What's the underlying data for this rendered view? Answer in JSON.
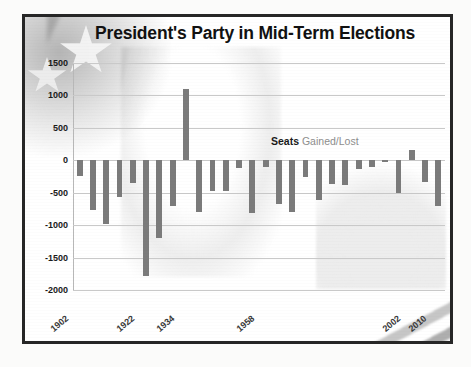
{
  "chart": {
    "title": "President's Party in Mid-Term Elections",
    "legend_bold": "Seats",
    "legend_light": "Gained/Lost",
    "bar_color": "#7b7b7b",
    "grid_color": "#c9c9c9",
    "frame_color": "#262626"
  },
  "chart_data": {
    "type": "bar",
    "title": "President's Party in Mid-Term Elections",
    "subtitle": "",
    "xlabel": "",
    "ylabel": "",
    "ylim": [
      -2000,
      1500
    ],
    "yticks": [
      1500,
      1000,
      500,
      0,
      -500,
      -1000,
      -1500,
      -2000
    ],
    "ytick_labels": [
      "1500",
      "1000",
      "500",
      "0",
      "-500",
      "-1000",
      "-1500",
      "-2000"
    ],
    "grid": true,
    "legend": "Seats Gained/Lost",
    "legend_position": "inside-upper-right",
    "xtick_labels": [
      "1902",
      "1922",
      "1934",
      "1958",
      "2002",
      "2010"
    ],
    "xtick_indices": [
      0,
      5,
      8,
      14,
      25,
      27
    ],
    "categories": [
      "1902",
      "1906",
      "1910",
      "1914",
      "1918",
      "1922",
      "1926",
      "1930",
      "1934",
      "1938",
      "1942",
      "1946",
      "1950",
      "1954",
      "1958",
      "1962",
      "1966",
      "1970",
      "1974",
      "1978",
      "1982",
      "1986",
      "1990",
      "1994",
      "1998",
      "2002",
      "2006",
      "2010"
    ],
    "values": [
      -240,
      -760,
      -980,
      -570,
      -350,
      -1790,
      -1200,
      -700,
      1100,
      -790,
      -480,
      -470,
      -120,
      -820,
      -100,
      -670,
      -790,
      -260,
      -620,
      -370,
      -380,
      -140,
      -110,
      -30,
      -500,
      160,
      -340,
      -700
    ],
    "series": [
      {
        "name": "Seats Gained/Lost",
        "values": [
          -240,
          -760,
          -980,
          -570,
          -350,
          -1790,
          -1200,
          -700,
          1100,
          -790,
          -480,
          -470,
          -120,
          -820,
          -100,
          -670,
          -790,
          -260,
          -620,
          -370,
          -380,
          -140,
          -110,
          -30,
          -500,
          160,
          -340,
          -700
        ]
      }
    ]
  }
}
